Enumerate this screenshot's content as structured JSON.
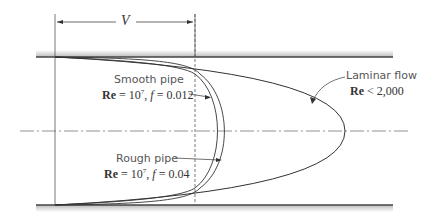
{
  "diagram": {
    "dimension": {
      "label": "V"
    },
    "labels": {
      "smooth": {
        "title": "Smooth pipe",
        "re_prefix": "Re",
        "re_eq": " = 10",
        "re_exp": "7",
        "f_part": ", ",
        "f_sym": "f",
        "f_val": " = 0.012"
      },
      "rough": {
        "title": "Rough pipe",
        "re_prefix": "Re",
        "re_eq": " = 10",
        "re_exp": "7",
        "f_part": ", ",
        "f_sym": "f",
        "f_val": " = 0.04"
      },
      "laminar": {
        "title": "Laminar flow",
        "re_prefix": "Re",
        "re_cond": " < 2,000"
      }
    },
    "colors": {
      "line": "#333333",
      "wall": "#444444",
      "centerline": "#666666"
    }
  }
}
